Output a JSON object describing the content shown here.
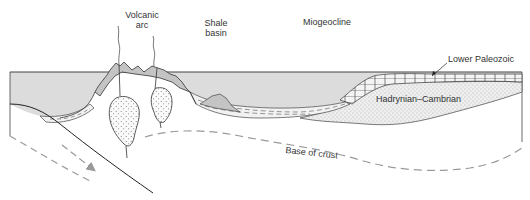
{
  "diagram": {
    "type": "geological-cross-section",
    "labels": {
      "volcanic_arc_line1": "Volcanic",
      "volcanic_arc_line2": "arc",
      "shale_basin_line1": "Shale",
      "shale_basin_line2": "basin",
      "miogeocline": "Miogeocline",
      "lower_paleozoic": "Lower Paleozoic",
      "hadrynian_cambrian": "Hadrynian–Cambrian",
      "base_of_crust": "Base of crust"
    },
    "colors": {
      "sea": "#dcdcdc",
      "volcanic": "#c4c4c4",
      "line": "#2b2b2b",
      "dashed": "#9a9a9a",
      "stipple": "#ebebeb",
      "background": "#ffffff"
    }
  }
}
